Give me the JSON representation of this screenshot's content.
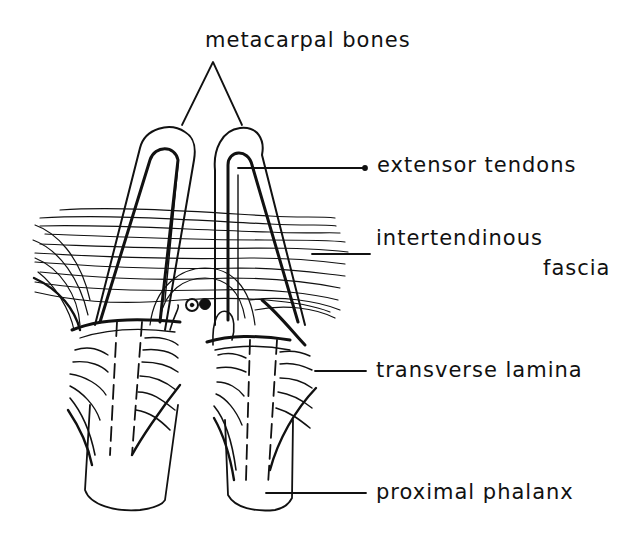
{
  "diagram": {
    "labels": {
      "metacarpal_bones": "metacarpal bones",
      "extensor_tendons": "extensor tendons",
      "intertendinous_line1": "intertendinous",
      "intertendinous_line2": "fascia",
      "transverse_lamina": "transverse lamina",
      "proximal_phalanx": "proximal phalanx"
    },
    "colors": {
      "ink": "#111111",
      "background": "#ffffff"
    }
  }
}
